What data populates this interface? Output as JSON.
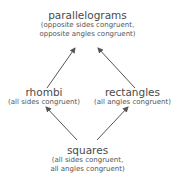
{
  "diagram": {
    "nodes": {
      "parallelograms": {
        "title": "parallelograms",
        "sub1": "(opposite sides congruent,",
        "sub2": "opposite angles congruent)"
      },
      "rhombi": {
        "title": "rhombi",
        "sub1": "(all sides congruent)"
      },
      "rectangles": {
        "title": "rectangles",
        "sub1": "(all angles congruent)"
      },
      "squares": {
        "title": "squares",
        "sub1": "(all sides congruent,",
        "sub2": "all angles congruent)"
      }
    },
    "edges": [
      {
        "from": "rhombi",
        "to": "parallelograms"
      },
      {
        "from": "rectangles",
        "to": "parallelograms"
      },
      {
        "from": "squares",
        "to": "rhombi"
      },
      {
        "from": "squares",
        "to": "rectangles"
      }
    ],
    "arrow_color": "#555555"
  }
}
